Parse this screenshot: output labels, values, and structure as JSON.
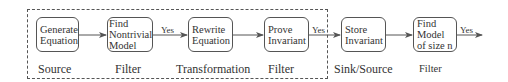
{
  "diagram": {
    "type": "pipeline-flowchart",
    "group": {
      "style": "dashed",
      "contains": [
        "generate-equation",
        "find-nontrivial-model",
        "rewrite-equation",
        "prove-invariant"
      ]
    },
    "nodes": [
      {
        "id": "generate-equation",
        "lines": [
          "Generate",
          "Equation"
        ],
        "role": "Source"
      },
      {
        "id": "find-nontrivial-model",
        "lines": [
          "Find",
          "Nontrivial",
          "Model"
        ],
        "role": "Filter"
      },
      {
        "id": "rewrite-equation",
        "lines": [
          "Rewrite",
          "Equation"
        ],
        "role": "Transformation"
      },
      {
        "id": "prove-invariant",
        "lines": [
          "Prove",
          "Invariant"
        ],
        "role": "Filter"
      },
      {
        "id": "store-invariant",
        "lines": [
          "Store",
          "Invariant"
        ],
        "role": "Sink/Source"
      },
      {
        "id": "find-model-size-n",
        "lines": [
          "Find",
          "Model",
          "of size n"
        ],
        "role": "Filter"
      }
    ],
    "edges": [
      {
        "from": "generate-equation",
        "to": "find-nontrivial-model",
        "label": ""
      },
      {
        "from": "find-nontrivial-model",
        "to": "rewrite-equation",
        "label": "Yes"
      },
      {
        "from": "rewrite-equation",
        "to": "prove-invariant",
        "label": ""
      },
      {
        "from": "prove-invariant",
        "to": "store-invariant",
        "label": "Yes"
      },
      {
        "from": "store-invariant",
        "to": "find-model-size-n",
        "label": ""
      },
      {
        "from": "find-model-size-n",
        "to": "output",
        "label": "Yes"
      }
    ],
    "colors": {
      "line": "#555555",
      "text": "#333333",
      "background": "#ffffff"
    }
  }
}
